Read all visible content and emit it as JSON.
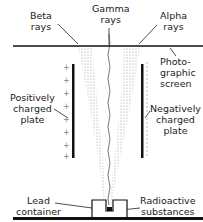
{
  "diagram": {
    "labels": {
      "beta": [
        "Beta",
        "rays"
      ],
      "gamma": [
        "Gamma",
        "rays"
      ],
      "alpha": [
        "Alpha",
        "rays"
      ],
      "screen": [
        "Photo-",
        "graphic",
        "screen"
      ],
      "positive_plate": [
        "Positively",
        "charged",
        "plate"
      ],
      "negative_plate": [
        "Negatively",
        "charged",
        "plate"
      ],
      "lead_container": [
        "Lead",
        "container"
      ],
      "radioactive": [
        "Radioactive",
        "substances"
      ]
    },
    "plus_sign": "+",
    "colors": {
      "ink": "#111111",
      "ray_dots": "#9a9a9a",
      "dash_marks": "#aaaaaa"
    }
  }
}
